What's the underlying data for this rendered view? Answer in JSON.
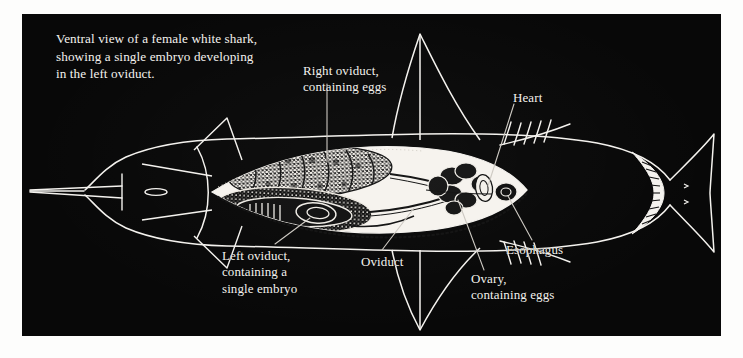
{
  "figure": {
    "domain": "scientific-illustration",
    "background_color": "#080808",
    "ink_color": "#f4f2ee",
    "page_color": "#fdfdfc",
    "caption": "Ventral view of a female white shark, showing a single embryo developing in the left oviduct.",
    "caption_lines": [
      "Ventral view of a female white shark,",
      "showing a single embryo developing",
      "in the left oviduct."
    ]
  },
  "labels": {
    "right_oviduct": {
      "line1": "Right oviduct,",
      "line2": "containing eggs"
    },
    "heart": {
      "line1": "Heart"
    },
    "left_oviduct": {
      "line1": "Left oviduct,",
      "line2": "containing a",
      "line3": "single embryo"
    },
    "oviduct": {
      "line1": "Oviduct"
    },
    "esophagus": {
      "line1": "Esophagus"
    },
    "ovary": {
      "line1": "Ovary,",
      "line2": "containing eggs"
    }
  },
  "anatomy": {
    "parts": [
      "snout",
      "head",
      "mouth",
      "gill-slits",
      "upper-pectoral-fin",
      "lower-pectoral-fin",
      "body-cavity",
      "right-oviduct",
      "left-oviduct",
      "embryo",
      "ovary",
      "heart",
      "esophagus",
      "caudal-fin"
    ]
  }
}
